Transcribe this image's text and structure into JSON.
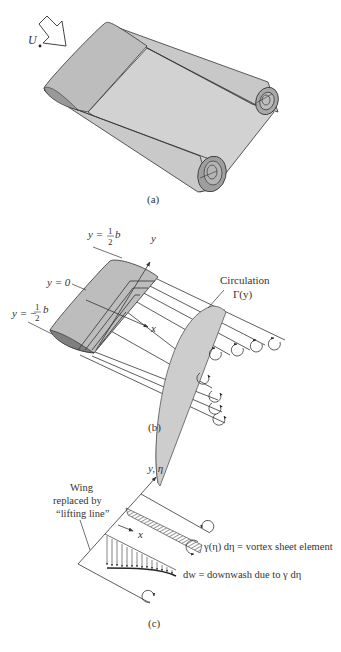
{
  "figure": {
    "panels": [
      {
        "id": "a",
        "caption": "(a)",
        "freestream_label": "U",
        "freestream_subscript": "∞",
        "description": "Wing with trailing vortex sheet rolling up into two tip vortices"
      },
      {
        "id": "b",
        "caption": "(b)",
        "labels": {
          "y_top": "y = ",
          "y_top_frac": "1/2",
          "y_top_b": "b",
          "y_zero": "y = 0",
          "y_bottom": "y = −",
          "y_bottom_frac": "1/2",
          "y_bottom_b": "b",
          "axis_y": "y",
          "axis_x": "x",
          "circulation_title": "Circulation",
          "circulation_symbol": "Γ(y)"
        },
        "description": "Horseshoe vortex system with elliptic circulation distribution"
      },
      {
        "id": "c",
        "caption": "(c)",
        "labels": {
          "axis_y_eta": "y, η",
          "axis_x": "x",
          "wing_line1": "Wing",
          "wing_line2": "replaced by",
          "wing_line3": "“lifting line”",
          "vortex_element": "γ(η) dη = vortex sheet element",
          "downwash": "dw = downwash due to γ dη"
        },
        "description": "Lifting-line model with vortex sheet element and induced downwash"
      }
    ],
    "colors": {
      "surface_light": "#cfcfcf",
      "surface_mid": "#b9b9b9",
      "surface_dark": "#8f8f8f",
      "line": "#333333"
    }
  }
}
